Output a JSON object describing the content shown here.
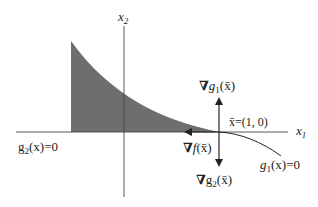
{
  "diagram": {
    "axes": {
      "x1_label": "x",
      "x1_sub": "1",
      "x2_label": "x",
      "x2_sub": "2"
    },
    "point_label": "x̄=(1, 0)",
    "grad_g1": {
      "nabla": "∇",
      "g": "g",
      "sub": "1",
      "arg": "(x̄)"
    },
    "grad_g2": {
      "nabla": "∇",
      "g": "g",
      "sub": "2",
      "arg": "(x̄)"
    },
    "grad_f": {
      "nabla": "∇",
      "f": "f",
      "arg": "(x̄)"
    },
    "constraint_g1": {
      "g": "g",
      "sub": "1",
      "rest": "(x)=0"
    },
    "constraint_g2": {
      "g": "g",
      "sub": "2",
      "rest": "(x)=0"
    },
    "colors": {
      "shade": "#707070",
      "line": "#333333"
    }
  }
}
